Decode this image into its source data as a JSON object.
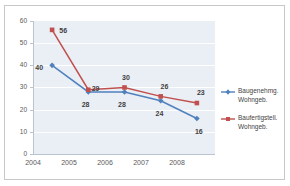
{
  "chart_data": {
    "type": "line",
    "title": "",
    "xlabel": "",
    "ylabel": "",
    "categories": [
      "2004",
      "2005",
      "2006",
      "2007",
      "2008"
    ],
    "ylim": [
      0,
      60
    ],
    "y_ticks": [
      "0",
      "10",
      "20",
      "30",
      "40",
      "50",
      "60"
    ],
    "grid": true,
    "legend_position": "right",
    "series": [
      {
        "name": "Baugenehmg. Wohngeb.",
        "name_line1": "Baugenehmg.",
        "name_line2": "Wohngeb.",
        "color": "#4f81bd",
        "marker": "diamond",
        "values": [
          40,
          28,
          28,
          24,
          16
        ],
        "labels": [
          "40",
          "28",
          "28",
          "24",
          "16"
        ]
      },
      {
        "name": "Baufertigstell. Wohngeb.",
        "name_line1": "Baufertigstell.",
        "name_line2": "Wohngeb.",
        "color": "#c0504d",
        "marker": "square",
        "values": [
          56,
          29,
          30,
          26,
          23
        ],
        "labels": [
          "56",
          "29",
          "30",
          "26",
          "23"
        ]
      }
    ],
    "colors": {
      "plot_background": "#eaeef5",
      "gridline": "#ffffff",
      "axis": "#b9c3d1",
      "frame_border": "#c8c8c8",
      "tick_text": "#5a5a5a",
      "label_text": "#3f3f3f"
    }
  }
}
